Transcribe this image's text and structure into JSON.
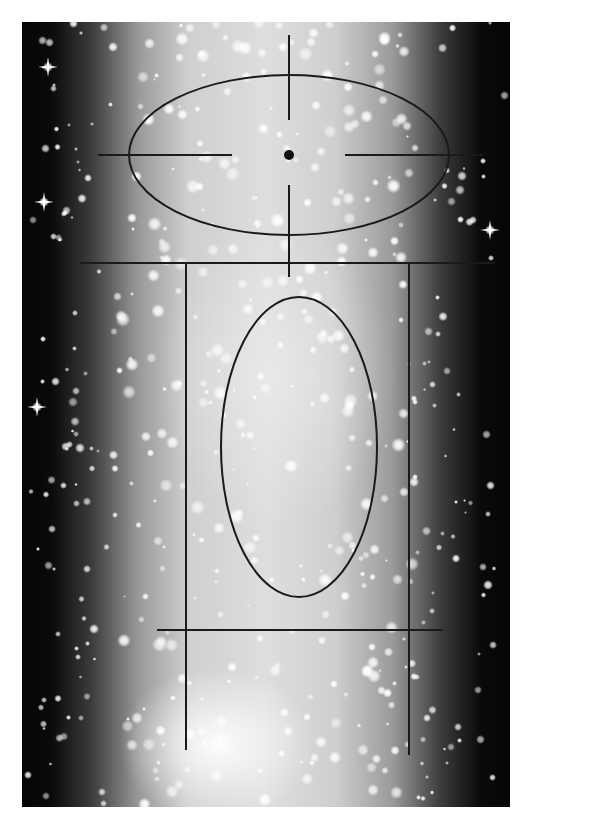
{
  "image": {
    "subject": "star cluster photograph with overlaid schematic annotations",
    "colors": {
      "background": "#ffffff",
      "sky_dark": "#050505",
      "cluster_core": "#dedede",
      "annotation": "#1a1a1a"
    }
  },
  "annotations": {
    "upper_ellipse": {
      "cx": 289,
      "cy": 155,
      "rx": 160,
      "ry": 80
    },
    "center_dot": {
      "cx": 289,
      "cy": 155,
      "r": 5
    },
    "crosshair": {
      "vertical_top": {
        "x": 289,
        "y1": 35,
        "y2": 120
      },
      "vertical_bottom": {
        "x": 289,
        "y1": 185,
        "y2": 277
      },
      "horizontal_left": {
        "y": 155,
        "x1": 98,
        "x2": 232
      },
      "horizontal_right": {
        "y": 155,
        "x1": 345,
        "x2": 483
      }
    },
    "upper_horizontal_line": {
      "y": 263,
      "x1": 80,
      "x2": 495
    },
    "left_vertical_line": {
      "x": 186,
      "y1": 263,
      "y2": 750
    },
    "right_vertical_line": {
      "x": 409,
      "y1": 263,
      "y2": 755
    },
    "inner_ellipse": {
      "cx": 299,
      "cy": 447,
      "rx": 78,
      "ry": 150
    },
    "lower_horizontal_line": {
      "y": 630,
      "x1": 157,
      "x2": 443
    }
  }
}
